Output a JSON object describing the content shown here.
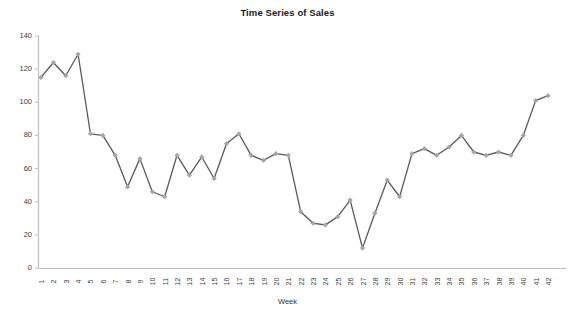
{
  "chart_data": {
    "type": "line",
    "title": "Time Series of Sales",
    "xlabel": "Week",
    "ylabel": "",
    "ylim": [
      0,
      140
    ],
    "ytick_step": 20,
    "yticks": [
      0,
      20,
      40,
      60,
      80,
      100,
      120,
      140
    ],
    "grid": false,
    "legend": "none",
    "marker": "diamond",
    "line_color": "#595959",
    "marker_color": "#A6A6A6",
    "axis_color": "#BFBFBF",
    "categories": [
      1,
      2,
      3,
      4,
      5,
      6,
      7,
      8,
      9,
      10,
      11,
      12,
      13,
      14,
      15,
      16,
      17,
      18,
      19,
      20,
      21,
      22,
      23,
      24,
      25,
      26,
      27,
      28,
      29,
      30,
      31,
      32,
      33,
      34,
      35,
      36,
      37,
      38,
      39,
      40,
      41,
      42
    ],
    "values": [
      115,
      124,
      116,
      129,
      81,
      80,
      68,
      49,
      66,
      46,
      43,
      68,
      56,
      67,
      54,
      75,
      81,
      68,
      65,
      69,
      68,
      34,
      27,
      26,
      31,
      41,
      12,
      33,
      53,
      43,
      69,
      72,
      68,
      73,
      80,
      70,
      68,
      70,
      68,
      80,
      101,
      104
    ],
    "series": [
      {
        "name": "Sales",
        "values": [
          115,
          124,
          116,
          129,
          81,
          80,
          68,
          49,
          66,
          46,
          43,
          68,
          56,
          67,
          54,
          75,
          81,
          68,
          65,
          69,
          68,
          34,
          27,
          26,
          31,
          41,
          12,
          33,
          53,
          43,
          69,
          72,
          68,
          73,
          80,
          70,
          68,
          70,
          68,
          80,
          101,
          104
        ]
      }
    ]
  }
}
